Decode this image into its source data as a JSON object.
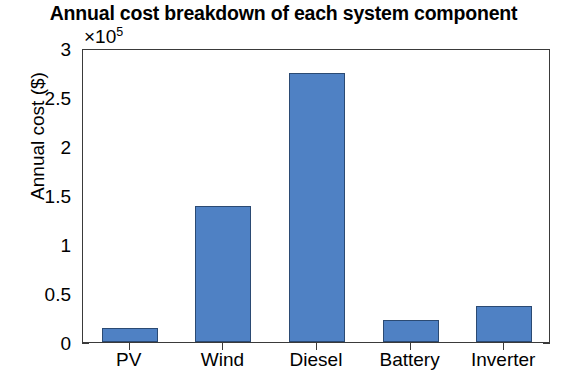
{
  "chart_data": {
    "type": "bar",
    "title": "Annual cost breakdown of each system component",
    "xlabel": "",
    "ylabel": "Annual cost ($)",
    "exponent_prefix": "×10",
    "exponent_power": "5",
    "exponent_label": "×10⁵",
    "categories": [
      "PV",
      "Wind",
      "Diesel",
      "Battery",
      "Inverter"
    ],
    "values": [
      0.14,
      1.39,
      2.74,
      0.22,
      0.37
    ],
    "value_scale": 100000,
    "values_absolute": [
      14000,
      139000,
      274000,
      22000,
      37000
    ],
    "ylim": [
      0,
      3
    ],
    "ytick_labels": [
      "0",
      "0.5",
      "1",
      "1.5",
      "2",
      "2.5",
      "3"
    ],
    "ytick_values": [
      0,
      0.5,
      1,
      1.5,
      2,
      2.5,
      3
    ],
    "grid": false,
    "legend": null,
    "bar_color": "#4f81c4",
    "bar_edge_color": "#2b4a73",
    "axis_color": "#3a3a3a",
    "background_color": "#ffffff"
  }
}
